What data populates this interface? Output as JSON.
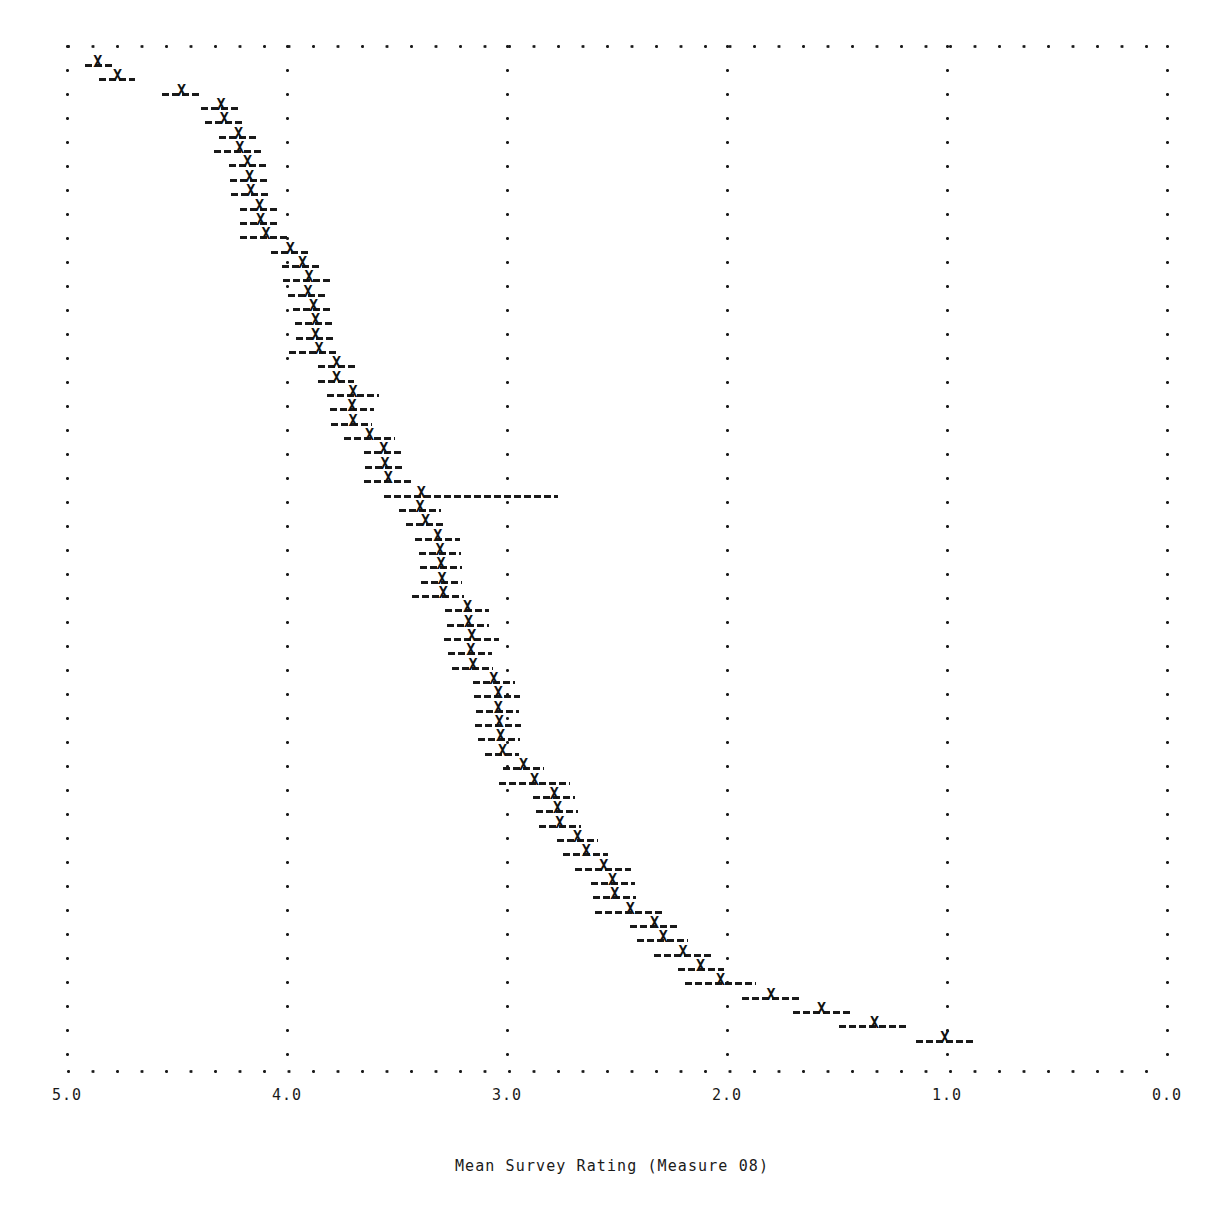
{
  "chart_data": {
    "type": "scatter",
    "plot_style": "caterpillar-forest-plot",
    "title": "",
    "subtitle": "",
    "xlabel": "Mean Survey Rating (Measure 08)",
    "ylabel": "",
    "xlim": [
      5.0,
      0.0
    ],
    "x_axis_reversed": true,
    "xticks": [
      5.0,
      4.0,
      3.0,
      2.0,
      1.0,
      0.0
    ],
    "xticklabels": [
      "5.0",
      "4.0",
      "3.0",
      "2.0",
      "1.0",
      "0.0"
    ],
    "grid": true,
    "grid_style": "dotted",
    "legend": null,
    "marker": "X",
    "error_bar_style": "dashed",
    "n_points": 68,
    "series_name": "Mean survey rating with confidence interval",
    "columns": [
      "mean",
      "ci_low",
      "ci_high"
    ],
    "points": [
      {
        "mean": 4.86,
        "ci_low": 4.92,
        "ci_high": 4.795
      },
      {
        "mean": 4.77,
        "ci_low": 4.855,
        "ci_high": 4.69
      },
      {
        "mean": 4.48,
        "ci_low": 4.57,
        "ci_high": 4.39
      },
      {
        "mean": 4.3,
        "ci_low": 4.39,
        "ci_high": 4.215
      },
      {
        "mean": 4.285,
        "ci_low": 4.375,
        "ci_high": 4.205
      },
      {
        "mean": 4.22,
        "ci_low": 4.31,
        "ci_high": 4.13
      },
      {
        "mean": 4.215,
        "ci_low": 4.33,
        "ci_high": 4.11
      },
      {
        "mean": 4.18,
        "ci_low": 4.265,
        "ci_high": 4.095
      },
      {
        "mean": 4.17,
        "ci_low": 4.26,
        "ci_high": 4.085
      },
      {
        "mean": 4.165,
        "ci_low": 4.255,
        "ci_high": 4.08
      },
      {
        "mean": 4.125,
        "ci_low": 4.215,
        "ci_high": 4.035
      },
      {
        "mean": 4.12,
        "ci_low": 4.215,
        "ci_high": 4.03
      },
      {
        "mean": 4.095,
        "ci_low": 4.215,
        "ci_high": 3.99
      },
      {
        "mean": 3.985,
        "ci_low": 4.075,
        "ci_high": 3.9
      },
      {
        "mean": 3.93,
        "ci_low": 4.025,
        "ci_high": 3.845
      },
      {
        "mean": 3.9,
        "ci_low": 4.02,
        "ci_high": 3.79
      },
      {
        "mean": 3.905,
        "ci_low": 3.995,
        "ci_high": 3.82
      },
      {
        "mean": 3.88,
        "ci_low": 3.975,
        "ci_high": 3.795
      },
      {
        "mean": 3.87,
        "ci_low": 3.965,
        "ci_high": 3.785
      },
      {
        "mean": 3.87,
        "ci_low": 3.96,
        "ci_high": 3.78
      },
      {
        "mean": 3.855,
        "ci_low": 3.99,
        "ci_high": 3.77
      },
      {
        "mean": 3.775,
        "ci_low": 3.86,
        "ci_high": 3.69
      },
      {
        "mean": 3.775,
        "ci_low": 3.86,
        "ci_high": 3.695
      },
      {
        "mean": 3.7,
        "ci_low": 3.82,
        "ci_high": 3.58
      },
      {
        "mean": 3.705,
        "ci_low": 3.805,
        "ci_high": 3.605
      },
      {
        "mean": 3.7,
        "ci_low": 3.8,
        "ci_high": 3.615
      },
      {
        "mean": 3.625,
        "ci_low": 3.74,
        "ci_high": 3.51
      },
      {
        "mean": 3.56,
        "ci_low": 3.65,
        "ci_high": 3.475
      },
      {
        "mean": 3.555,
        "ci_low": 3.645,
        "ci_high": 3.47
      },
      {
        "mean": 3.54,
        "ci_low": 3.65,
        "ci_high": 3.435
      },
      {
        "mean": 3.39,
        "ci_low": 3.56,
        "ci_high": 2.77
      },
      {
        "mean": 3.395,
        "ci_low": 3.49,
        "ci_high": 3.3
      },
      {
        "mean": 3.37,
        "ci_low": 3.46,
        "ci_high": 3.28
      },
      {
        "mean": 3.315,
        "ci_low": 3.42,
        "ci_high": 3.215
      },
      {
        "mean": 3.305,
        "ci_low": 3.4,
        "ci_high": 3.21
      },
      {
        "mean": 3.3,
        "ci_low": 3.395,
        "ci_high": 3.205
      },
      {
        "mean": 3.295,
        "ci_low": 3.39,
        "ci_high": 3.205
      },
      {
        "mean": 3.29,
        "ci_low": 3.43,
        "ci_high": 3.195
      },
      {
        "mean": 3.18,
        "ci_low": 3.28,
        "ci_high": 3.08
      },
      {
        "mean": 3.175,
        "ci_low": 3.275,
        "ci_high": 3.08
      },
      {
        "mean": 3.16,
        "ci_low": 3.285,
        "ci_high": 3.035
      },
      {
        "mean": 3.165,
        "ci_low": 3.27,
        "ci_high": 3.07
      },
      {
        "mean": 3.155,
        "ci_low": 3.25,
        "ci_high": 3.065
      },
      {
        "mean": 3.06,
        "ci_low": 3.155,
        "ci_high": 2.965
      },
      {
        "mean": 3.04,
        "ci_low": 3.15,
        "ci_high": 2.94
      },
      {
        "mean": 3.04,
        "ci_low": 3.14,
        "ci_high": 2.945
      },
      {
        "mean": 3.035,
        "ci_low": 3.145,
        "ci_high": 2.935
      },
      {
        "mean": 3.03,
        "ci_low": 3.13,
        "ci_high": 2.94
      },
      {
        "mean": 3.02,
        "ci_low": 3.1,
        "ci_high": 2.945
      },
      {
        "mean": 2.925,
        "ci_low": 3.02,
        "ci_high": 2.83
      },
      {
        "mean": 2.875,
        "ci_low": 3.035,
        "ci_high": 2.715
      },
      {
        "mean": 2.785,
        "ci_low": 2.88,
        "ci_high": 2.69
      },
      {
        "mean": 2.77,
        "ci_low": 2.87,
        "ci_high": 2.675
      },
      {
        "mean": 2.76,
        "ci_low": 2.855,
        "ci_high": 2.665
      },
      {
        "mean": 2.68,
        "ci_low": 2.775,
        "ci_high": 2.585
      },
      {
        "mean": 2.64,
        "ci_low": 2.745,
        "ci_high": 2.54
      },
      {
        "mean": 2.56,
        "ci_low": 2.69,
        "ci_high": 2.435
      },
      {
        "mean": 2.52,
        "ci_low": 2.62,
        "ci_high": 2.42
      },
      {
        "mean": 2.51,
        "ci_low": 2.61,
        "ci_high": 2.415
      },
      {
        "mean": 2.44,
        "ci_low": 2.6,
        "ci_high": 2.29
      },
      {
        "mean": 2.33,
        "ci_low": 2.44,
        "ci_high": 2.225
      },
      {
        "mean": 2.29,
        "ci_low": 2.41,
        "ci_high": 2.175
      },
      {
        "mean": 2.2,
        "ci_low": 2.33,
        "ci_high": 2.065
      },
      {
        "mean": 2.12,
        "ci_low": 2.225,
        "ci_high": 2.015
      },
      {
        "mean": 2.03,
        "ci_low": 2.19,
        "ci_high": 1.87
      },
      {
        "mean": 1.8,
        "ci_low": 1.93,
        "ci_high": 1.665
      },
      {
        "mean": 1.57,
        "ci_low": 1.7,
        "ci_high": 1.44
      },
      {
        "mean": 1.33,
        "ci_low": 1.49,
        "ci_high": 1.175
      },
      {
        "mean": 1.01,
        "ci_low": 1.14,
        "ci_high": 0.87
      }
    ]
  },
  "axis": {
    "x_title": "Mean Survey Rating (Measure 08)",
    "tick_labels": [
      "5.0",
      "4.0",
      "3.0",
      "2.0",
      "1.0",
      "0.0"
    ]
  },
  "colors": {
    "ink": "#1a1a1a",
    "background": "#ffffff"
  }
}
